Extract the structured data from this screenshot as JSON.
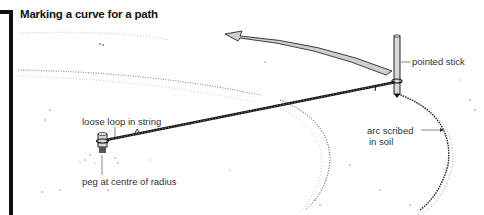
{
  "figure": {
    "title": "Marking a curve for a path",
    "labels": {
      "pointed_stick": "pointed stick",
      "loose_loop": "loose loop in string",
      "peg": "peg at centre of radius",
      "arc_line1": "arc scribed",
      "arc_line2": "in soil"
    },
    "colors": {
      "ink": "#111111",
      "arrow_fill": "#cfcfcf",
      "stick_fill": "#d8d8d8",
      "label_text": "#333333"
    },
    "icons": [
      "curved-arrow-icon",
      "pointed-stick-icon",
      "peg-icon",
      "string-icon"
    ]
  }
}
